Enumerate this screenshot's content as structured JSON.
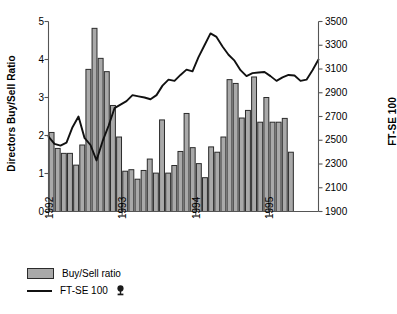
{
  "chart_data": {
    "type": "bar",
    "title": "",
    "xlabel": "",
    "ylabel": "Directors Buy/Sell Ratio",
    "y2label": "FT-SE 100",
    "ylim": [
      0,
      5
    ],
    "y2lim": [
      1900,
      3500
    ],
    "yticks": [
      0,
      1,
      2,
      3,
      4,
      5
    ],
    "y2ticks": [
      1900,
      2100,
      2300,
      2500,
      2700,
      2900,
      3100,
      3300,
      3500
    ],
    "xticks": [
      "1992",
      "1993",
      "1994",
      "1995"
    ],
    "xtick_positions": [
      0,
      12,
      24,
      36
    ],
    "grid": false,
    "legend_position": "below-left",
    "n_points": 44,
    "series": [
      {
        "name": "Buy/Sell ratio",
        "type": "bar",
        "axis": "left",
        "color": "#a9a9a9",
        "edge_color": "#2b2b2b",
        "values": [
          2.08,
          1.66,
          1.53,
          1.53,
          1.22,
          1.75,
          3.74,
          4.82,
          4.03,
          3.68,
          2.79,
          1.96,
          1.06,
          1.1,
          0.85,
          1.08,
          1.38,
          1.01,
          2.41,
          1.01,
          1.21,
          1.58,
          2.58,
          1.68,
          1.26,
          0.89,
          1.7,
          1.56,
          1.96,
          3.47,
          3.37,
          2.46,
          2.66,
          3.54,
          2.35,
          3.0,
          2.35,
          2.35,
          2.45,
          1.56
        ]
      },
      {
        "name": "FT-SE 100",
        "type": "line",
        "axis": "right",
        "color": "#111111",
        "values": [
          2530,
          2470,
          2455,
          2480,
          2610,
          2700,
          2520,
          2460,
          2330,
          2490,
          2620,
          2770,
          2800,
          2830,
          2880,
          2870,
          2860,
          2845,
          2880,
          2960,
          3010,
          3000,
          3050,
          3095,
          3080,
          3200,
          3300,
          3400,
          3370,
          3290,
          3220,
          3170,
          3090,
          3040,
          3065,
          3070,
          3075,
          3040,
          3000,
          3030,
          3050,
          3045,
          3000,
          3010,
          3090,
          3180
        ]
      }
    ]
  },
  "legend": {
    "items": [
      {
        "label": "Buy/Sell ratio",
        "marker": "bar-swatch"
      },
      {
        "label": "FT-SE 100",
        "marker": "line"
      }
    ]
  }
}
